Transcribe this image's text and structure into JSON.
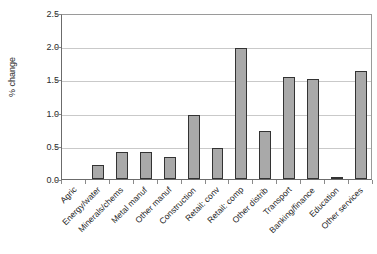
{
  "chart_data": {
    "type": "bar",
    "title": "",
    "xlabel": "",
    "ylabel": "% change",
    "ylim": [
      0,
      2.5
    ],
    "ytick_labels": [
      "0.0",
      "0.5",
      "1.0",
      "1.5",
      "2.0",
      "2.5"
    ],
    "ytick_values": [
      0.0,
      0.5,
      1.0,
      1.5,
      2.0,
      2.5
    ],
    "grid": true,
    "legend": false,
    "categories": [
      "Agric",
      "Energy/water",
      "Minerals/chems",
      "Metal manuf",
      "Other manuf",
      "Construction",
      "Retail: conv",
      "Retail: comp",
      "Other distrib",
      "Transport",
      "Banking/finance",
      "Education",
      "Other services"
    ],
    "values": [
      0.0,
      0.21,
      0.41,
      0.41,
      0.33,
      0.96,
      0.46,
      1.97,
      0.72,
      1.53,
      1.51,
      0.03,
      1.62
    ],
    "bar_color": "#a9a9a9",
    "bar_edge_color": "#333333",
    "grid_color": "#c9c9c9",
    "axis_color": "#6b6b6b",
    "background": "#ffffff"
  }
}
